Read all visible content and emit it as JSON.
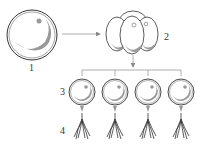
{
  "labels": {
    "l1": "1",
    "l2": "2",
    "l3": "3",
    "l4": "4"
  },
  "colors": {
    "outline": "#333333",
    "shade": "#999999",
    "arrow": "#888888"
  },
  "elements": {
    "stage1": "single cell",
    "stage2": "cell cluster",
    "stage3": "four separated cells",
    "stage4": "root-like structures"
  }
}
